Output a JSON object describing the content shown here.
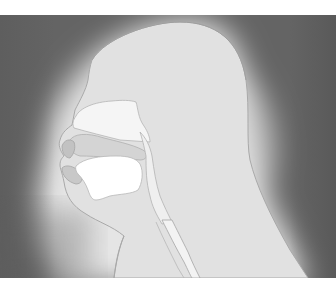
{
  "figure": {
    "panel": {
      "top": 15,
      "bottom": 278,
      "background_dark": "#5e5e5e",
      "glow_center": "#eaeaea",
      "glow_mid": "#d8d8d8"
    },
    "colors": {
      "head_fill": "#e2e2e2",
      "outline": "#a8a8a8",
      "nasal_cavity": "#f6f6f6",
      "oral_cavity": "#ffffff",
      "airway": "#f2f2f2",
      "lip_shade": "#c4c4c4",
      "palate_shade": "#d0d0d0"
    },
    "parts": [
      {
        "id": "head-outline",
        "label": ""
      },
      {
        "id": "nasal-cavity",
        "label": ""
      },
      {
        "id": "hard-palate",
        "label": ""
      },
      {
        "id": "oral-cavity",
        "label": ""
      },
      {
        "id": "lips",
        "label": ""
      },
      {
        "id": "pharynx",
        "label": ""
      },
      {
        "id": "trachea",
        "label": ""
      },
      {
        "id": "neck",
        "label": ""
      }
    ]
  }
}
